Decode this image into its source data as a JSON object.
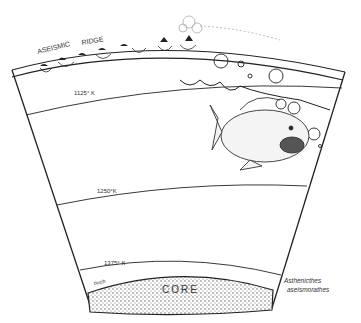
{
  "diagram": {
    "labels": {
      "ridge_word1": "ASEISMIC",
      "ridge_word2": "RIDGE",
      "isotherm_1": "1125° K",
      "isotherm_2": "1250°K",
      "isotherm_3": "1375° K",
      "ouch": "ouch",
      "core": "CORE",
      "species_line1": "Asthenicthes",
      "species_line2": "aseismorathes"
    },
    "colors": {
      "ink": "#222222",
      "background": "#ffffff",
      "stipple": "#555555"
    }
  }
}
